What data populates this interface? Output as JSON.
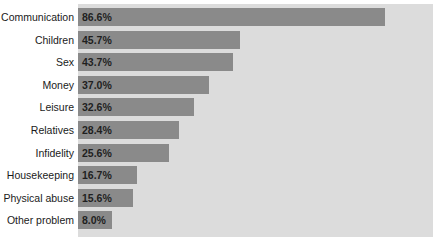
{
  "chart_data": {
    "type": "bar",
    "orientation": "horizontal",
    "title": "",
    "subtitle": "",
    "xlabel": "",
    "ylabel": "",
    "xlim": [
      0,
      100
    ],
    "grid": false,
    "legend": false,
    "axis_ticks_visible": false,
    "value_suffix": "%",
    "categories": [
      "Communication",
      "Children",
      "Sex",
      "Money",
      "Leisure",
      "Relatives",
      "Infidelity",
      "Housekeeping",
      "Physical abuse",
      "Other problem"
    ],
    "values": [
      86.6,
      45.7,
      43.7,
      37.0,
      32.6,
      28.4,
      25.6,
      16.7,
      15.6,
      8.0
    ],
    "value_labels": [
      "86.6%",
      "45.7%",
      "43.7%",
      "37.0%",
      "32.6%",
      "28.4%",
      "25.6%",
      "16.7%",
      "15.6%",
      "8.0%"
    ],
    "colors": {
      "bar": "#8a8a8a",
      "plot_background": "#dcdcdc",
      "figure_background": "#ffffff",
      "label_text": "#1a1a1a",
      "value_text": "#1f1f1f"
    }
  }
}
